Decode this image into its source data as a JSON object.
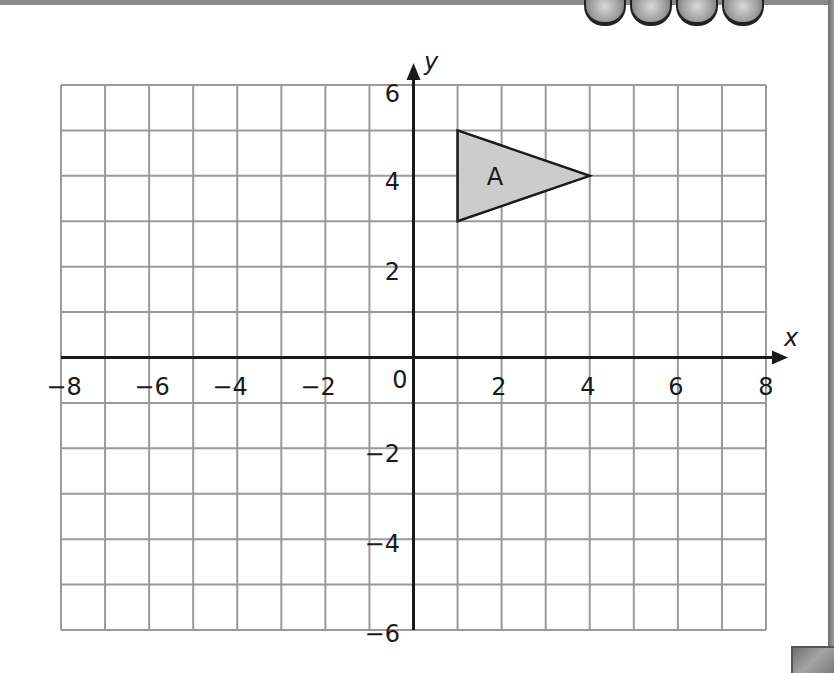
{
  "chart_data": {
    "type": "scatter",
    "title": "",
    "xlabel": "x",
    "ylabel": "y",
    "xlim": [
      -8,
      8
    ],
    "ylim": [
      -6,
      6
    ],
    "grid": true,
    "grid_step": 1,
    "x_ticks": [
      -8,
      -6,
      -4,
      -2,
      0,
      2,
      4,
      6,
      8
    ],
    "y_ticks": [
      -6,
      -4,
      -2,
      2,
      4,
      6
    ],
    "x_tick_labels": [
      "−8",
      "−6",
      "−4",
      "−2",
      "0",
      "2",
      "4",
      "6",
      "8"
    ],
    "y_tick_labels": [
      "−6",
      "−4",
      "−2",
      "2",
      "4",
      "6"
    ],
    "shapes": [
      {
        "name": "A",
        "type": "triangle",
        "vertices": [
          [
            1,
            5
          ],
          [
            4,
            4
          ],
          [
            1,
            3
          ]
        ],
        "fill": "#cccccc",
        "stroke": "#1a1a1a"
      }
    ]
  },
  "colors": {
    "grid": "#9a9a9a",
    "axis": "#1a1a1a",
    "shape_fill": "#cccccc",
    "frame": "#8a8a8a"
  },
  "labels": {
    "x_axis": "x",
    "y_axis": "y",
    "shape_a": "A",
    "origin": "0",
    "x_neg8": "−8",
    "x_neg6": "−6",
    "x_neg4": "−4",
    "x_neg2": "−2",
    "x_2": "2",
    "x_4": "4",
    "x_6": "6",
    "x_8": "8",
    "y_6": "6",
    "y_4": "4",
    "y_2": "2",
    "y_neg2": "−2",
    "y_neg4": "−4",
    "y_neg6": "−6"
  },
  "decorations": {
    "gem_count": 4
  }
}
